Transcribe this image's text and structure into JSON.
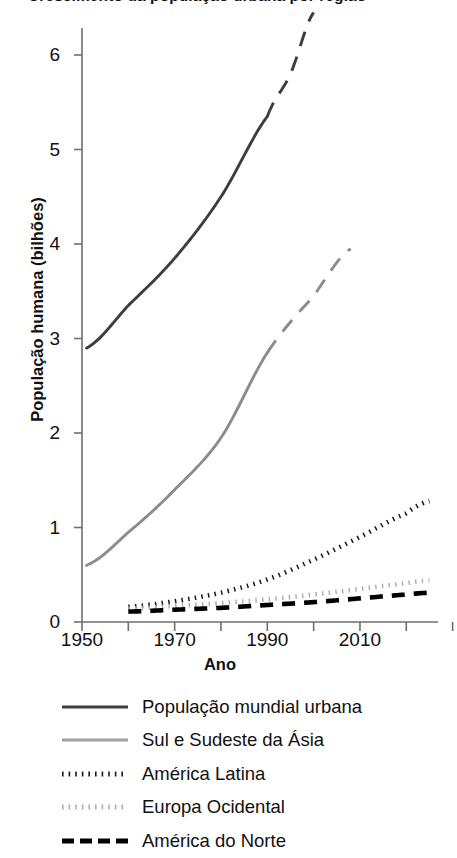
{
  "figure": {
    "title_partial": "Crescimento da população urbana por região",
    "width": 457,
    "height": 858
  },
  "axes": {
    "ylabel": "População humana (bilhões)",
    "xlabel": "Ano",
    "yticks": [
      "0",
      "1",
      "2",
      "3",
      "4",
      "5",
      "6"
    ],
    "xticks": [
      "1950",
      "1970",
      "1990",
      "2010"
    ]
  },
  "legend": {
    "items": [
      {
        "label": "População mundial urbana",
        "style": "solid",
        "color": "#3d3d3d"
      },
      {
        "label": "Sul e Sudeste da Ásia",
        "style": "solid",
        "color": "#a0a0a0"
      },
      {
        "label": "América Latina",
        "style": "dotted",
        "color": "#1a1a1a"
      },
      {
        "label": "Europa Ocidental",
        "style": "dotted",
        "color": "#b0b0b0"
      },
      {
        "label": "América do Norte",
        "style": "dashed",
        "color": "#000000"
      }
    ]
  },
  "chart_data": {
    "type": "line",
    "title": "Crescimento da população urbana por região",
    "xlabel": "Ano",
    "ylabel": "População humana (bilhões)",
    "xlim": [
      1950,
      2030
    ],
    "ylim": [
      0,
      6.4
    ],
    "xticks": [
      1950,
      1970,
      1990,
      2010
    ],
    "xticks_minor": [
      1960,
      1980,
      2000,
      2020
    ],
    "yticks": [
      0,
      1,
      2,
      3,
      4,
      5,
      6
    ],
    "grid": false,
    "legend_position": "below",
    "units": "bilhões de pessoas",
    "series": [
      {
        "name": "População mundial urbana",
        "color": "#3d3d3d",
        "linestyle": "solid",
        "projection_from": 1990,
        "projection_linestyle": "dashed",
        "x": [
          1951,
          1960,
          1970,
          1980,
          1990,
          1995,
          2000
        ],
        "y": [
          2.9,
          3.35,
          3.85,
          4.5,
          5.35,
          5.8,
          6.45
        ]
      },
      {
        "name": "Sul e Sudeste da Ásia",
        "color": "#8c8c8c",
        "linestyle": "solid",
        "projection_from": 1990,
        "projection_linestyle": "dashed",
        "x": [
          1951,
          1960,
          1970,
          1980,
          1990,
          2000,
          2008
        ],
        "y": [
          0.6,
          0.95,
          1.4,
          1.95,
          2.85,
          3.45,
          3.95
        ]
      },
      {
        "name": "América Latina",
        "color": "#1a1a1a",
        "linestyle": "dotted",
        "x": [
          1960,
          1970,
          1980,
          1990,
          2000,
          2010,
          2020,
          2025
        ],
        "y": [
          0.16,
          0.22,
          0.31,
          0.45,
          0.66,
          0.9,
          1.15,
          1.28
        ]
      },
      {
        "name": "Europa Ocidental",
        "color": "#b0b0b0",
        "linestyle": "dotted",
        "x": [
          1960,
          1970,
          1980,
          1990,
          2000,
          2010,
          2020,
          2025
        ],
        "y": [
          0.14,
          0.17,
          0.2,
          0.24,
          0.29,
          0.35,
          0.41,
          0.44
        ]
      },
      {
        "name": "América do Norte",
        "color": "#000000",
        "linestyle": "dashed",
        "x": [
          1960,
          1970,
          1980,
          1990,
          2000,
          2010,
          2020,
          2025
        ],
        "y": [
          0.11,
          0.13,
          0.15,
          0.18,
          0.21,
          0.25,
          0.29,
          0.31
        ]
      }
    ]
  }
}
